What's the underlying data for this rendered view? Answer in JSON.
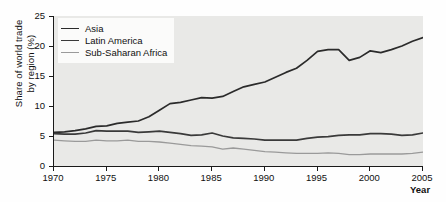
{
  "chart_data": {
    "type": "line",
    "title": "",
    "xlabel": "Year",
    "ylabel": "Share of world trade\nby region (%)",
    "xlim": [
      1970,
      2005
    ],
    "ylim": [
      0,
      25
    ],
    "grid": false,
    "legend_position": "top-left",
    "xticks": [
      "1970",
      "1975",
      "1980",
      "1985",
      "1990",
      "1995",
      "2000",
      "2005"
    ],
    "xtick_values": [
      1970,
      1975,
      1980,
      1985,
      1990,
      1995,
      2000,
      2005
    ],
    "yticks": [
      "0",
      "5",
      "10",
      "15",
      "20",
      "25"
    ],
    "ytick_values": [
      0,
      5,
      10,
      15,
      20,
      25
    ],
    "x": [
      1970,
      1971,
      1972,
      1973,
      1974,
      1975,
      1976,
      1977,
      1978,
      1979,
      1980,
      1981,
      1982,
      1983,
      1984,
      1985,
      1986,
      1987,
      1988,
      1989,
      1990,
      1991,
      1992,
      1993,
      1994,
      1995,
      1996,
      1997,
      1998,
      1999,
      2000,
      2001,
      2002,
      2003,
      2004,
      2005
    ],
    "series": [
      {
        "name": "Asia",
        "color": "#2b2b2b",
        "values": [
          5.6,
          5.7,
          5.9,
          6.2,
          6.6,
          6.7,
          7.1,
          7.3,
          7.5,
          8.2,
          9.3,
          10.4,
          10.6,
          11.0,
          11.4,
          11.3,
          11.6,
          12.4,
          13.2,
          13.6,
          14.0,
          14.8,
          15.6,
          16.3,
          17.6,
          19.1,
          19.4,
          19.4,
          17.6,
          18.1,
          19.2,
          18.9,
          19.4,
          20.0,
          20.8,
          21.4
        ]
      },
      {
        "name": "Latin America",
        "color": "#3a3a3a",
        "values": [
          5.4,
          5.3,
          5.3,
          5.5,
          5.9,
          5.8,
          5.8,
          5.8,
          5.6,
          5.7,
          5.8,
          5.6,
          5.4,
          5.1,
          5.2,
          5.5,
          5.0,
          4.7,
          4.6,
          4.5,
          4.3,
          4.3,
          4.3,
          4.3,
          4.6,
          4.8,
          4.9,
          5.1,
          5.2,
          5.2,
          5.4,
          5.4,
          5.3,
          5.1,
          5.2,
          5.5
        ]
      },
      {
        "name": "Sub-Saharan Africa",
        "color": "#9a9a9a",
        "values": [
          4.3,
          4.2,
          4.1,
          4.1,
          4.3,
          4.2,
          4.2,
          4.3,
          4.1,
          4.1,
          4.0,
          3.8,
          3.6,
          3.4,
          3.3,
          3.2,
          2.8,
          3.0,
          2.8,
          2.6,
          2.4,
          2.3,
          2.2,
          2.1,
          2.1,
          2.1,
          2.2,
          2.1,
          1.9,
          1.9,
          2.0,
          2.0,
          2.0,
          2.0,
          2.1,
          2.3
        ]
      }
    ]
  },
  "legend": {
    "items": [
      {
        "label": "Asia",
        "color": "#2b2b2b"
      },
      {
        "label": "Latin America",
        "color": "#3a3a3a"
      },
      {
        "label": "Sub-Saharan Africa",
        "color": "#9a9a9a"
      }
    ]
  }
}
